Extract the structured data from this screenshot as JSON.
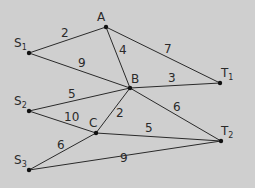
{
  "diagram": {
    "type": "weighted-graph",
    "background": "#cfcfcf",
    "nodes": [
      {
        "id": "A",
        "label": "A",
        "sub": "",
        "x": 106,
        "y": 27
      },
      {
        "id": "S1",
        "label": "S",
        "sub": "1",
        "x": 29,
        "y": 53
      },
      {
        "id": "B",
        "label": "B",
        "sub": "",
        "x": 130,
        "y": 88
      },
      {
        "id": "T1",
        "label": "T",
        "sub": "1",
        "x": 220,
        "y": 83
      },
      {
        "id": "S2",
        "label": "S",
        "sub": "2",
        "x": 29,
        "y": 111
      },
      {
        "id": "C",
        "label": "C",
        "sub": "",
        "x": 96,
        "y": 133
      },
      {
        "id": "T2",
        "label": "T",
        "sub": "2",
        "x": 221,
        "y": 141
      },
      {
        "id": "S3",
        "label": "S",
        "sub": "3",
        "x": 29,
        "y": 170
      }
    ],
    "edges": [
      {
        "from": "S1",
        "to": "A",
        "weight": "2"
      },
      {
        "from": "S1",
        "to": "B",
        "weight": "9"
      },
      {
        "from": "A",
        "to": "B",
        "weight": "4"
      },
      {
        "from": "A",
        "to": "T1",
        "weight": "7"
      },
      {
        "from": "B",
        "to": "T1",
        "weight": "3"
      },
      {
        "from": "S2",
        "to": "B",
        "weight": "5"
      },
      {
        "from": "S2",
        "to": "C",
        "weight": "10"
      },
      {
        "from": "C",
        "to": "B",
        "weight": "2"
      },
      {
        "from": "B",
        "to": "T2",
        "weight": "6"
      },
      {
        "from": "C",
        "to": "T2",
        "weight": "5"
      },
      {
        "from": "S3",
        "to": "C",
        "weight": "6"
      },
      {
        "from": "S3",
        "to": "T2",
        "weight": "9"
      }
    ]
  },
  "node_labels": {
    "A": "A",
    "B": "B",
    "C": "C",
    "S1": "S",
    "S1_sub": "1",
    "S2": "S",
    "S2_sub": "2",
    "S3": "S",
    "S3_sub": "3",
    "T1": "T",
    "T1_sub": "1",
    "T2": "T",
    "T2_sub": "2"
  },
  "edge_labels": {
    "S1_A": "2",
    "S1_B": "9",
    "A_B": "4",
    "A_T1": "7",
    "B_T1": "3",
    "S2_B": "5",
    "S2_C": "10",
    "C_B": "2",
    "B_T2": "6",
    "C_T2": "5",
    "S3_C": "6",
    "S3_T2": "9"
  }
}
